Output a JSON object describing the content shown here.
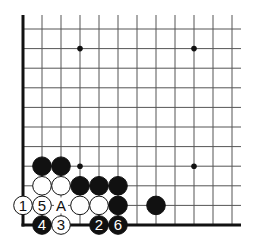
{
  "diagram": {
    "type": "go-board-corner",
    "corner": "bottom-left",
    "grid": {
      "columns": 12,
      "rows": 11,
      "x0": 23,
      "dx": 19,
      "y0": 29,
      "dy": 19.6,
      "extend_right": 241,
      "extend_top": 15
    },
    "star_points": [
      {
        "c": 3,
        "r": 1
      },
      {
        "c": 9,
        "r": 1
      },
      {
        "c": 3,
        "r": 7
      },
      {
        "c": 9,
        "r": 7
      }
    ],
    "stones": [
      {
        "c": 1,
        "r": 7,
        "color": "black",
        "label": ""
      },
      {
        "c": 2,
        "r": 7,
        "color": "black",
        "label": ""
      },
      {
        "c": 1,
        "r": 8,
        "color": "white",
        "label": ""
      },
      {
        "c": 2,
        "r": 8,
        "color": "white",
        "label": ""
      },
      {
        "c": 3,
        "r": 8,
        "color": "black",
        "label": ""
      },
      {
        "c": 4,
        "r": 8,
        "color": "black",
        "label": ""
      },
      {
        "c": 5,
        "r": 8,
        "color": "black",
        "label": ""
      },
      {
        "c": 0,
        "r": 9,
        "color": "white",
        "label": "1"
      },
      {
        "c": 1,
        "r": 9,
        "color": "white",
        "label": "5"
      },
      {
        "c": 3,
        "r": 9,
        "color": "white",
        "label": ""
      },
      {
        "c": 4,
        "r": 9,
        "color": "white",
        "label": ""
      },
      {
        "c": 5,
        "r": 9,
        "color": "black",
        "label": ""
      },
      {
        "c": 7,
        "r": 9,
        "color": "black",
        "label": ""
      },
      {
        "c": 1,
        "r": 10,
        "color": "black",
        "label": "4"
      },
      {
        "c": 2,
        "r": 10,
        "color": "white",
        "label": "3"
      },
      {
        "c": 4,
        "r": 10,
        "color": "black",
        "label": "2"
      },
      {
        "c": 5,
        "r": 10,
        "color": "black",
        "label": "6"
      }
    ],
    "markers": [
      {
        "c": 2,
        "r": 9,
        "label": "A"
      }
    ],
    "colors": {
      "line": "#555555",
      "edge": "#111111",
      "black_stone": "#111111",
      "white_stone": "#ffffff",
      "background": "#ffffff"
    }
  }
}
